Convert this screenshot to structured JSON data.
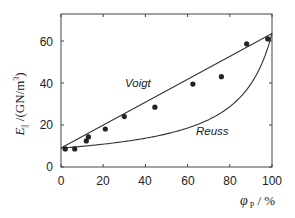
{
  "chart_data": {
    "type": "scatter",
    "title": "",
    "xlabel": "φ_P / %",
    "ylabel": "E_∥ / (GN/m³)",
    "xlim": [
      0,
      100
    ],
    "ylim": [
      0,
      72
    ],
    "xticks": [
      0,
      20,
      40,
      60,
      80,
      100
    ],
    "yticks": [
      0,
      20,
      40,
      60
    ],
    "grid": false,
    "legend": "none (inline curve labels)",
    "series": [
      {
        "name": "Measured",
        "kind": "scatter",
        "x": [
          2,
          6.5,
          12,
          13,
          21,
          30,
          44.5,
          62.5,
          76,
          88,
          98
        ],
        "y": [
          8.6,
          8.6,
          12.4,
          14.3,
          18.1,
          24,
          28.5,
          39.5,
          43,
          58.6,
          61
        ]
      },
      {
        "name": "Voigt",
        "kind": "line",
        "x": [
          0,
          100
        ],
        "y": [
          9,
          63.6
        ]
      },
      {
        "name": "Reuss",
        "kind": "curve",
        "formula": "1/E = f/Ep + (1-f)/Em",
        "Em": 9,
        "Ep": 63.6,
        "x": [
          0,
          10,
          20,
          30,
          40,
          50,
          60,
          70,
          80,
          90,
          95,
          100
        ],
        "y": [
          9,
          9.9,
          10.9,
          12.3,
          14,
          16.2,
          19.2,
          23.4,
          29.8,
          40.8,
          50.1,
          63.6
        ]
      }
    ],
    "annotations": [
      {
        "text": "Voigt",
        "near": [
          40,
          22
        ]
      },
      {
        "text": "Reuss",
        "near": [
          66,
          8
        ]
      }
    ]
  },
  "labels": {
    "x_ticks": [
      "0",
      "20",
      "40",
      "60",
      "80",
      "100"
    ],
    "y_ticks": [
      "0",
      "20",
      "40",
      "60"
    ],
    "voigt": "Voigt",
    "reuss": "Reuss",
    "x_axis_symbol": "φ",
    "x_axis_sub": "P",
    "x_axis_unit": " / %",
    "y_axis_symbol": "E",
    "y_axis_sub": "||",
    "y_axis_unit": " /(GN/m",
    "y_axis_sup": "3",
    "y_axis_close": ")"
  }
}
